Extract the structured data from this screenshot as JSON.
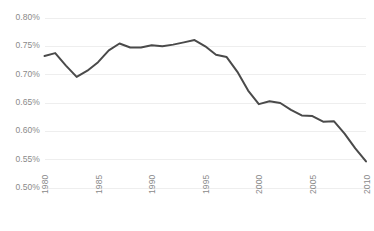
{
  "chart_data": {
    "type": "line",
    "title": "",
    "subtitle": "",
    "xlabel": "",
    "ylabel": "",
    "grid": "horizontal",
    "legend_position": "none",
    "xlim": [
      1980,
      2010
    ],
    "ylim": [
      0.5,
      0.8
    ],
    "ytick_labels": [
      "0.80%",
      "0.75%",
      "0.70%",
      "0.65%",
      "0.60%",
      "0.55%",
      "0.50%"
    ],
    "ytick_values": [
      0.8,
      0.75,
      0.7,
      0.65,
      0.6,
      0.55,
      0.5
    ],
    "xtick_labels": [
      "1980",
      "1985",
      "1990",
      "1995",
      "2000",
      "2005",
      "2010"
    ],
    "xtick_values": [
      1980,
      1985,
      1990,
      1995,
      2000,
      2005,
      2010
    ],
    "series": [
      {
        "name": "",
        "color": "#4a4a4a",
        "x": [
          1980,
          1981,
          1982,
          1983,
          1984,
          1985,
          1986,
          1987,
          1988,
          1989,
          1990,
          1991,
          1992,
          1993,
          1994,
          1995,
          1996,
          1997,
          1998,
          1999,
          2000,
          2001,
          2002,
          2003,
          2004,
          2005,
          2006,
          2007,
          2008,
          2009,
          2010
        ],
        "values": [
          0.733,
          0.738,
          0.716,
          0.696,
          0.707,
          0.722,
          0.743,
          0.755,
          0.748,
          0.748,
          0.752,
          0.75,
          0.753,
          0.757,
          0.761,
          0.75,
          0.735,
          0.731,
          0.705,
          0.672,
          0.648,
          0.653,
          0.65,
          0.638,
          0.628,
          0.627,
          0.617,
          0.618,
          0.596,
          0.57,
          0.547
        ]
      }
    ]
  },
  "axes": {
    "line_color": "#4a4a4a",
    "grid_color": "#eeeeee",
    "tick_text_color": "#8a8a8a",
    "background": "#ffffff"
  }
}
